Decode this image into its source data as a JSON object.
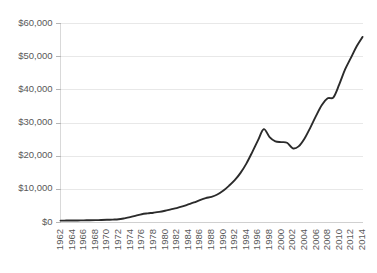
{
  "chart_data": {
    "type": "line",
    "title": "",
    "subtitle": "",
    "xlabel": "",
    "ylabel": "",
    "grid": "horizontal",
    "legend": "none",
    "xlim": [
      1962,
      2014
    ],
    "ylim": [
      0,
      60000
    ],
    "ytick_labels": [
      "$60,000",
      "$50,000",
      "$40,000",
      "$30,000",
      "$20,000",
      "$10,000",
      "$0"
    ],
    "ytick_values": [
      60000,
      50000,
      40000,
      30000,
      20000,
      10000,
      0
    ],
    "xtick_labels": [
      "1962",
      "1964",
      "1966",
      "1968",
      "1970",
      "1972",
      "1974",
      "1976",
      "1978",
      "1980",
      "1982",
      "1984",
      "1986",
      "1988",
      "1990",
      "1992",
      "1994",
      "1996",
      "1998",
      "2000",
      "2002",
      "2004",
      "2006",
      "2008",
      "2010",
      "2012",
      "2014"
    ],
    "series": [
      {
        "name": "",
        "color": "#2b2b2b",
        "x": [
          1962,
          1963,
          1964,
          1965,
          1966,
          1967,
          1968,
          1969,
          1970,
          1971,
          1972,
          1973,
          1974,
          1975,
          1976,
          1977,
          1978,
          1979,
          1980,
          1981,
          1982,
          1983,
          1984,
          1985,
          1986,
          1987,
          1988,
          1989,
          1990,
          1991,
          1992,
          1993,
          1994,
          1995,
          1996,
          1997,
          1998,
          1999,
          2000,
          2001,
          2002,
          2003,
          2004,
          2005,
          2006,
          2007,
          2008,
          2009,
          2010,
          2011,
          2012,
          2013,
          2014
        ],
        "values": [
          420,
          430,
          450,
          470,
          500,
          530,
          560,
          600,
          660,
          730,
          820,
          1100,
          1450,
          1900,
          2350,
          2600,
          2800,
          3050,
          3400,
          3800,
          4200,
          4700,
          5300,
          5900,
          6600,
          7200,
          7600,
          8300,
          9400,
          10900,
          12600,
          14800,
          17600,
          21000,
          24600,
          28000,
          25600,
          24300,
          24100,
          23900,
          22200,
          22800,
          25100,
          28400,
          32000,
          35300,
          37300,
          37600,
          41500,
          46000,
          49500,
          53000,
          55800
        ]
      }
    ],
    "annotations": []
  },
  "axis": {
    "y_axis_name": "y-axis",
    "x_axis_name": "x-axis"
  }
}
